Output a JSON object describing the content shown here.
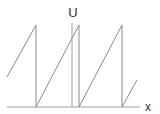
{
  "diagram": {
    "type": "sawtooth-wave",
    "axis_labels": {
      "y": "U",
      "x": "x"
    },
    "colors": {
      "line": "#8a8a8a",
      "axis": "#a0a0a0",
      "text": "#333333",
      "background": "#ffffff"
    },
    "axes": {
      "x_axis": {
        "x1": 7,
        "y1": 107,
        "x2": 140,
        "y2": 107
      },
      "y_axis": {
        "x1": 72,
        "y1": 23,
        "x2": 72,
        "y2": 107
      }
    },
    "waveform_points": [
      [
        7,
        77
      ],
      [
        36,
        25
      ],
      [
        36,
        107
      ],
      [
        79,
        25
      ],
      [
        79,
        107
      ],
      [
        122,
        25
      ],
      [
        122,
        107
      ],
      [
        137,
        80
      ]
    ]
  }
}
